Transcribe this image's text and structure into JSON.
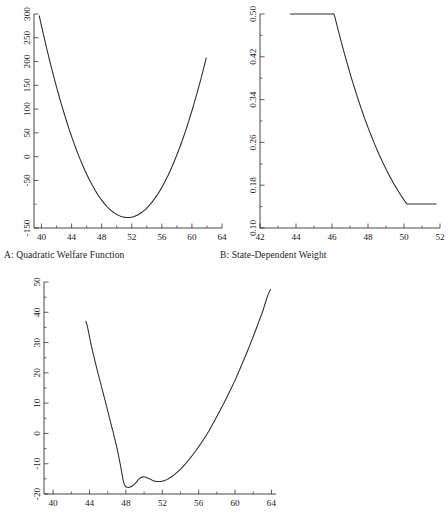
{
  "figure": {
    "background": "#ffffff",
    "line_color": "#2b2b2b",
    "axis_color": "#1a1a1a"
  },
  "captions": {
    "panel_a": "A: Quadratic Welfare Function",
    "panel_b": "B: State-Dependent Weight"
  },
  "chart_data": [
    {
      "id": "panel-a",
      "type": "line",
      "title": "A: Quadratic Welfare Function",
      "xlabel": "",
      "ylabel": "",
      "xlim": [
        39.0,
        64.0
      ],
      "ylim": [
        -150,
        300
      ],
      "xticks": [
        40,
        44,
        48,
        52,
        56,
        60,
        64
      ],
      "xtick_labels": [
        "40",
        "44",
        "48",
        "52",
        "56",
        "60",
        "64"
      ],
      "yticks": [
        -150,
        -50,
        0,
        50,
        100,
        150,
        200,
        250,
        300
      ],
      "ytick_labels": [
        "-150",
        "-50",
        "0",
        "50",
        "100",
        "150",
        "200",
        "250",
        "300"
      ],
      "minor_xticks": [
        42,
        46,
        50,
        54,
        58,
        62
      ],
      "minor_yticks": [
        -100
      ],
      "grid": false,
      "legend": "none",
      "series": [
        {
          "name": "quadratic welfare",
          "x": [
            39.7,
            40.5,
            41.5,
            42.5,
            43.5,
            44.5,
            45.5,
            46.5,
            47.5,
            48.5,
            49.5,
            50.5,
            51.5,
            52.5,
            53.5,
            54.5,
            55.5,
            56.5,
            57.5,
            58.5,
            59.5,
            60.5,
            61.5,
            61.9
          ],
          "y": [
            296,
            253,
            206,
            162,
            122,
            85,
            52,
            22,
            -4,
            -27,
            -46,
            -62,
            -74,
            -82,
            -87,
            -88,
            -86,
            -80,
            -70,
            -57,
            -40,
            -20,
            4,
            197
          ]
        }
      ],
      "annotations": [
        "minimum near x = 51.5, y = -128"
      ]
    },
    {
      "id": "panel-b",
      "type": "line",
      "title": "B: State-Dependent Weight",
      "xlabel": "",
      "ylabel": "",
      "xlim": [
        42.0,
        52.0
      ],
      "ylim": [
        0.1,
        0.5
      ],
      "xticks": [
        42,
        44,
        46,
        48,
        50,
        52
      ],
      "xtick_labels": [
        "42",
        "44",
        "46",
        "48",
        "50",
        "52"
      ],
      "yticks": [
        0.1,
        0.18,
        0.26,
        0.34,
        0.42,
        0.5
      ],
      "ytick_labels": [
        "0.10",
        "0.18",
        "0.26",
        "0.34",
        "0.42",
        "0.50"
      ],
      "minor_xticks": [
        43,
        45,
        47,
        49,
        51
      ],
      "minor_yticks": [
        0.14,
        0.22,
        0.3,
        0.38,
        0.46
      ],
      "grid": false,
      "legend": "none",
      "series": [
        {
          "name": "state-dependent weight",
          "x": [
            43.7,
            44.5,
            45.2,
            45.8,
            46.1,
            46.4,
            46.8,
            47.2,
            47.6,
            48.0,
            48.4,
            48.8,
            49.2,
            49.5,
            49.8,
            50.1,
            50.5,
            51.0,
            51.5,
            51.8
          ],
          "y": [
            0.5,
            0.5,
            0.5,
            0.5,
            0.5,
            0.468,
            0.415,
            0.362,
            0.31,
            0.262,
            0.222,
            0.19,
            0.166,
            0.155,
            0.148,
            0.145,
            0.145,
            0.145,
            0.145,
            0.145
          ]
        }
      ],
      "annotations": [
        "plateau at 0.50 up to x = 46.1",
        "plateau at 0.145 beyond x = 50.1"
      ]
    },
    {
      "id": "panel-c",
      "type": "line",
      "title": "",
      "xlabel": "",
      "ylabel": "",
      "xlim": [
        39.0,
        64.5
      ],
      "ylim": [
        -20,
        50
      ],
      "xticks": [
        40,
        44,
        48,
        52,
        56,
        60,
        64
      ],
      "xtick_labels": [
        "40",
        "44",
        "48",
        "52",
        "56",
        "60",
        "64"
      ],
      "yticks": [
        -20,
        -10,
        0,
        10,
        20,
        30,
        40,
        50
      ],
      "ytick_labels": [
        "-20",
        "-10",
        "0",
        "10",
        "20",
        "30",
        "40",
        "50"
      ],
      "minor_xticks": [
        42,
        46,
        50,
        54,
        58,
        62
      ],
      "minor_yticks": [
        -15,
        -5,
        5,
        15,
        25,
        35,
        45
      ],
      "grid": false,
      "legend": "none",
      "series": [
        {
          "name": "welfare with state-dependent weight",
          "x": [
            43.6,
            44.2,
            44.8,
            45.4,
            46.0,
            46.6,
            47.0,
            47.4,
            47.8,
            48.2,
            48.6,
            49.0,
            49.4,
            49.8,
            50.2,
            50.6,
            51.0,
            51.6,
            52.2,
            53.0,
            54.0,
            55.0,
            56.0,
            57.0,
            58.0,
            59.0,
            60.0,
            61.0,
            62.0,
            63.0,
            63.9
          ],
          "y": [
            37.0,
            29.0,
            21.5,
            14.5,
            7.5,
            0.5,
            -4.5,
            -10.5,
            -16.6,
            -17.8,
            -17.5,
            -16.6,
            -15.2,
            -14.4,
            -14.5,
            -15.0,
            -15.6,
            -15.9,
            -15.6,
            -14.3,
            -11.8,
            -8.4,
            -4.4,
            0.2,
            5.6,
            11.4,
            17.6,
            24.6,
            32.0,
            40.0,
            47.5
          ]
        }
      ],
      "annotations": [
        "local minimum near x = 48.2, y = -17.8",
        "local maximum near x = 49.8, y = -14.4",
        "local minimum near x = 51.6, y = -15.9"
      ]
    }
  ]
}
